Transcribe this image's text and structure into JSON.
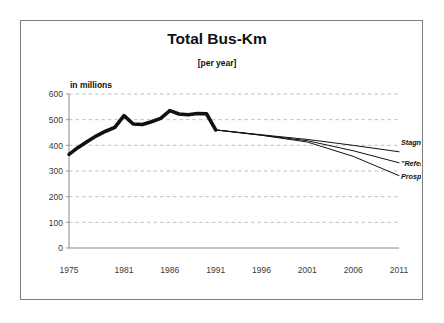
{
  "chart_data": {
    "type": "line",
    "title": "Total Bus-Km",
    "subtitle": "[per year]",
    "unit_label": "in millions",
    "xlabel": "",
    "ylabel": "",
    "ylim": [
      0,
      600
    ],
    "xlim": [
      1975,
      2011
    ],
    "grid": true,
    "legend_position": "inline-right-end",
    "y_ticks": [
      "0",
      "100",
      "200",
      "300",
      "400",
      "500",
      "600"
    ],
    "y_tick_values": [
      0,
      100,
      200,
      300,
      400,
      500,
      600
    ],
    "x_ticks": [
      "1975",
      "1981",
      "1986",
      "1991",
      "1996",
      "2001",
      "2006",
      "2011"
    ],
    "x_tick_values": [
      1975,
      1981,
      1986,
      1991,
      1996,
      2001,
      2006,
      2011
    ],
    "series": [
      {
        "name": "Historical",
        "style": "thick-black",
        "x": [
          1975,
          1976,
          1977,
          1978,
          1979,
          1980,
          1981,
          1982,
          1983,
          1984,
          1985,
          1986,
          1987,
          1988,
          1989,
          1990,
          1991
        ],
        "values": [
          365,
          392,
          415,
          437,
          455,
          470,
          516,
          483,
          481,
          492,
          505,
          535,
          522,
          519,
          524,
          523,
          460
        ]
      },
      {
        "name": "Stagnation",
        "style": "thin-black",
        "x": [
          1991,
          1996,
          2001,
          2006,
          2011
        ],
        "values": [
          460,
          441,
          423,
          400,
          375
        ]
      },
      {
        "name": "\"Reference\"",
        "style": "thin-black",
        "x": [
          1991,
          1996,
          2001,
          2006,
          2011
        ],
        "values": [
          460,
          440,
          418,
          379,
          332
        ]
      },
      {
        "name": "Prosperity",
        "style": "thin-black",
        "x": [
          1991,
          1996,
          2001,
          2006,
          2011
        ],
        "values": [
          460,
          439,
          413,
          357,
          282
        ]
      }
    ],
    "annotations": [
      {
        "text": "Stagnation",
        "year": 2011,
        "value": 400
      },
      {
        "text": "\"Reference\"",
        "year": 2011,
        "value": 318
      },
      {
        "text": "Prosperity",
        "year": 2011,
        "value": 268
      }
    ],
    "colors": {
      "line": "#111111",
      "grid": "#b9b9b9",
      "axis": "#8a8a8a",
      "border": "#7d7d7d",
      "text": "#222222"
    }
  }
}
